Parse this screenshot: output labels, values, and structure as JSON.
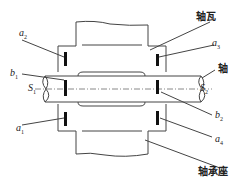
{
  "diagram": {
    "labels": {
      "bearing_shell": "轴瓦",
      "shaft": "轴",
      "bearing_seat": "轴承座"
    },
    "sensors": [
      {
        "id": "a2",
        "letter": "a",
        "sub": "2"
      },
      {
        "id": "a3",
        "letter": "a",
        "sub": "3"
      },
      {
        "id": "b1",
        "letter": "b",
        "sub": "1"
      },
      {
        "id": "b2",
        "letter": "b",
        "sub": "2"
      },
      {
        "id": "a1",
        "letter": "a",
        "sub": "1"
      },
      {
        "id": "a4",
        "letter": "a",
        "sub": "4"
      },
      {
        "id": "S1",
        "letter": "S",
        "sub": "1"
      },
      {
        "id": "S2",
        "letter": "S",
        "sub": "2"
      }
    ],
    "colors": {
      "line": "#333333",
      "sensor": "#111111"
    }
  }
}
